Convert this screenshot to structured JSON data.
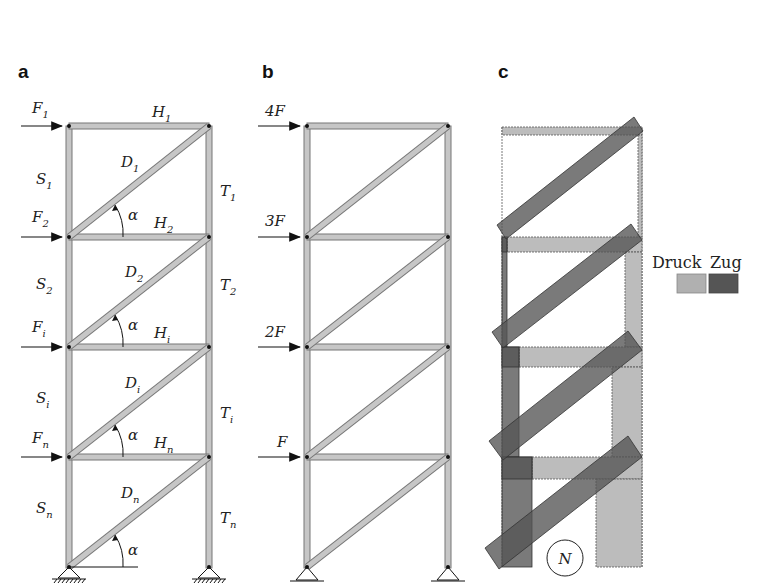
{
  "panels": {
    "a": {
      "label": "a",
      "forces": [
        "F",
        "F",
        "F",
        "F"
      ],
      "force_subs": [
        "1",
        "2",
        "i",
        "n"
      ],
      "horizontals": [
        "H",
        "H",
        "H",
        "H"
      ],
      "horizontal_subs": [
        "1",
        "2",
        "i",
        "n"
      ],
      "diagonals": [
        "D",
        "D",
        "D",
        "D"
      ],
      "diagonal_subs": [
        "1",
        "2",
        "i",
        "n"
      ],
      "left_columns": [
        "S",
        "S",
        "S",
        "S"
      ],
      "left_column_subs": [
        "1",
        "2",
        "i",
        "n"
      ],
      "right_columns": [
        "T",
        "T",
        "T",
        "T"
      ],
      "right_column_subs": [
        "1",
        "2",
        "i",
        "n"
      ],
      "angle_label": "α"
    },
    "b": {
      "label": "b",
      "forces": [
        "4F",
        "3F",
        "2F",
        "F"
      ]
    },
    "c": {
      "label": "c",
      "legend": {
        "compression_label": "Druck",
        "tension_label": "Zug",
        "compression_color": "#b0b0b0",
        "tension_color": "#555555"
      },
      "normal_force_symbol": "N"
    }
  }
}
